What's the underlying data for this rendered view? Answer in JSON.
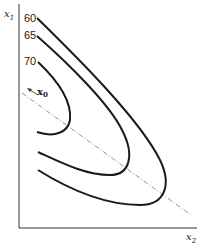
{
  "diagram": {
    "axes": {
      "y_label": "x",
      "y_label_sub": "1",
      "x_label": "x",
      "x_label_sub": "2"
    },
    "contours": [
      {
        "label": "60"
      },
      {
        "label": "65"
      },
      {
        "label": "70"
      }
    ],
    "start_point": {
      "label": "x",
      "sub": "0"
    },
    "colors": {
      "line": "#1a1a1a",
      "dashed": "#777777",
      "background": "#ffffff"
    }
  }
}
